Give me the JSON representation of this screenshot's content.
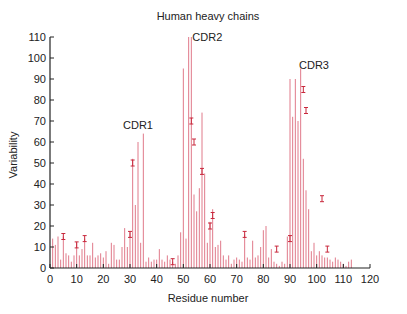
{
  "chart_data": {
    "type": "bar",
    "title": "Human heavy chains",
    "xlabel": "Residue number",
    "ylabel": "Variability",
    "xlim": [
      0,
      120
    ],
    "ylim": [
      0,
      110
    ],
    "xticks": [
      0,
      10,
      20,
      30,
      40,
      50,
      60,
      70,
      80,
      90,
      100,
      110,
      120
    ],
    "yticks": [
      0,
      10,
      20,
      30,
      40,
      50,
      60,
      70,
      80,
      90,
      100,
      110
    ],
    "grid": false,
    "legend": null,
    "bar_color": "#e07a8a",
    "annotations": [
      {
        "text": "CDR1",
        "x": 33,
        "y": 66
      },
      {
        "text": "CDR2",
        "x": 59,
        "y": 108
      },
      {
        "text": "CDR3",
        "x": 99,
        "y": 95
      }
    ],
    "x": [
      1,
      2,
      3,
      4,
      5,
      6,
      7,
      8,
      9,
      10,
      11,
      12,
      13,
      14,
      15,
      16,
      17,
      18,
      19,
      20,
      21,
      22,
      23,
      24,
      25,
      26,
      27,
      28,
      29,
      30,
      31,
      32,
      33,
      34,
      35,
      36,
      37,
      38,
      39,
      40,
      41,
      42,
      43,
      44,
      45,
      46,
      47,
      48,
      49,
      50,
      51,
      52,
      53,
      54,
      55,
      56,
      57,
      58,
      59,
      60,
      61,
      62,
      63,
      64,
      65,
      66,
      67,
      68,
      69,
      70,
      71,
      72,
      73,
      74,
      75,
      76,
      77,
      78,
      79,
      80,
      81,
      82,
      83,
      84,
      85,
      86,
      87,
      88,
      89,
      90,
      91,
      92,
      93,
      94,
      95,
      96,
      97,
      98,
      99,
      100,
      101,
      102,
      103,
      104,
      105,
      106,
      107,
      108,
      109,
      110,
      111,
      112,
      113
    ],
    "values": [
      14,
      11,
      15,
      4,
      15,
      7,
      6,
      3,
      6,
      12,
      6,
      9,
      14,
      6,
      6,
      12,
      5,
      6,
      7,
      5,
      8,
      2,
      12,
      11,
      4,
      4,
      10,
      19,
      10,
      17,
      52,
      30,
      60,
      12,
      64,
      3,
      5,
      3,
      4,
      4,
      9,
      4,
      3,
      6,
      4,
      3,
      2,
      6,
      17,
      95,
      14,
      110,
      110,
      35,
      27,
      38,
      74,
      45,
      12,
      22,
      28,
      10,
      11,
      13,
      6,
      4,
      6,
      2,
      4,
      5,
      4,
      3,
      16,
      5,
      4,
      13,
      5,
      6,
      10,
      18,
      20,
      5,
      9,
      3,
      2,
      1,
      3,
      2,
      15,
      90,
      72,
      90,
      70,
      95,
      52,
      37,
      28,
      8,
      12,
      6,
      8,
      6,
      5,
      5,
      4,
      3,
      5,
      4,
      3,
      2,
      1,
      3,
      4
    ],
    "errors": [
      {
        "x": 5,
        "y": 15
      },
      {
        "x": 10,
        "y": 11
      },
      {
        "x": 13,
        "y": 14
      },
      {
        "x": 31,
        "y": 50
      },
      {
        "x": 30,
        "y": 16
      },
      {
        "x": 46,
        "y": 3
      },
      {
        "x": 53,
        "y": 70
      },
      {
        "x": 54,
        "y": 60
      },
      {
        "x": 57,
        "y": 46
      },
      {
        "x": 60,
        "y": 20
      },
      {
        "x": 61,
        "y": 25
      },
      {
        "x": 73,
        "y": 16
      },
      {
        "x": 85,
        "y": 9
      },
      {
        "x": 90,
        "y": 14
      },
      {
        "x": 95,
        "y": 85
      },
      {
        "x": 96,
        "y": 75
      },
      {
        "x": 102,
        "y": 33
      },
      {
        "x": 104,
        "y": 9
      }
    ]
  }
}
